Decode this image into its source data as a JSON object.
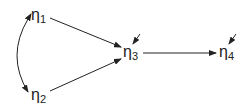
{
  "diagram": {
    "type": "path-diagram",
    "nodes": [
      {
        "id": "eta1",
        "symbol": "η",
        "subscript": "1"
      },
      {
        "id": "eta2",
        "symbol": "η",
        "subscript": "2"
      },
      {
        "id": "eta3",
        "symbol": "η",
        "subscript": "3"
      },
      {
        "id": "eta4",
        "symbol": "η",
        "subscript": "4"
      }
    ],
    "edges": [
      {
        "from": "eta1",
        "to": "eta3",
        "type": "directed"
      },
      {
        "from": "eta2",
        "to": "eta3",
        "type": "directed"
      },
      {
        "from": "eta3",
        "to": "eta4",
        "type": "directed"
      },
      {
        "from": "eta1",
        "to": "eta2",
        "type": "bidirectional-curved"
      }
    ],
    "disturbances": [
      {
        "target": "eta3"
      },
      {
        "target": "eta4"
      }
    ],
    "colors": {
      "stroke": "#222222",
      "background": "#ffffff"
    }
  }
}
